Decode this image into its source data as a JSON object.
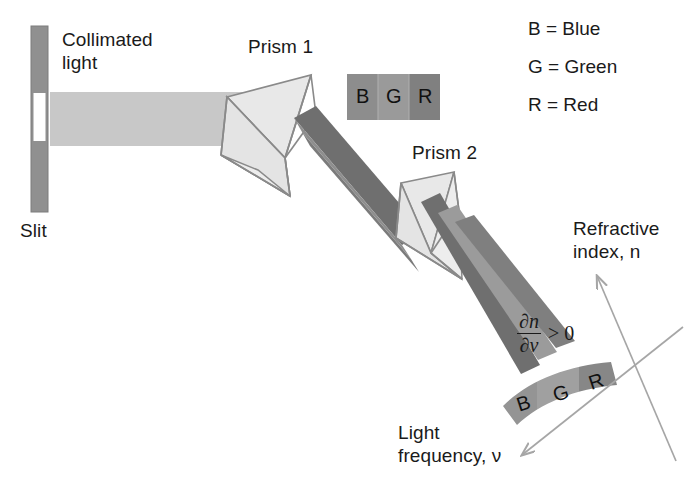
{
  "figure": {
    "width": 693,
    "height": 481,
    "background": "#ffffff"
  },
  "labels": {
    "slit": "Slit",
    "collimated_light": "Collimated\nlight",
    "prism1": "Prism 1",
    "prism2": "Prism 2",
    "refractive_index": "Refractive\nindex, n",
    "light_frequency": "Light\nfrequency, ν"
  },
  "legend": {
    "items": [
      {
        "key": "B",
        "equals": "=",
        "value": "Blue",
        "text": "B = Blue"
      },
      {
        "key": "G",
        "equals": "=",
        "value": "Green",
        "text": "G = Green"
      },
      {
        "key": "R",
        "equals": "=",
        "value": "Red",
        "text": "R = Red"
      }
    ]
  },
  "formula": {
    "numerator": "∂n",
    "denominator": "∂ν",
    "relation": "> 0",
    "full": "∂n/∂ν > 0"
  },
  "flat_band": {
    "name": "bgr-flat-band",
    "segments": [
      {
        "letter": "B",
        "fill": "#8d8d8d"
      },
      {
        "letter": "G",
        "fill": "#9a9a9a"
      },
      {
        "letter": "R",
        "fill": "#808080"
      }
    ]
  },
  "curved_band": {
    "name": "bgr-curved-band",
    "segments": [
      {
        "letter": "B",
        "fill": "#949494"
      },
      {
        "letter": "G",
        "fill": "#a0a0a0"
      },
      {
        "letter": "R",
        "fill": "#878787"
      }
    ]
  },
  "colors": {
    "beam_collimated": "#c8c8c8",
    "beam_blue": "#6f6f6f",
    "beam_green": "#8e8e8e",
    "beam_red": "#7a7a7a",
    "prism_fill": "#e4e4e4",
    "prism_edge": "#8a8a8a",
    "slit_bar": "#909090",
    "slit_gap": "#ffffff",
    "axis_line": "#a6a6a6",
    "text": "#1a1a1a"
  },
  "slit": {
    "name": "slit-aperture",
    "bar_color": "#909090",
    "gap_color": "#ffffff"
  },
  "axes": {
    "vertical_axis_label": "Refractive index, n",
    "horizontal_axis_label": "Light frequency, ν",
    "arrowheads": 2
  }
}
